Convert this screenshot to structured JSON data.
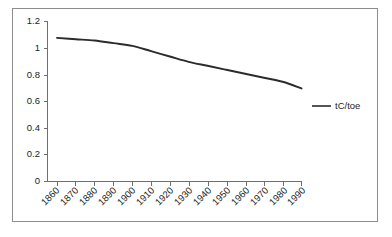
{
  "chart_data": {
    "type": "line",
    "title": "",
    "subtitle": "",
    "xlabel": "",
    "ylabel": "",
    "grid": false,
    "legend_position": "right",
    "xlim": [
      1860,
      1990
    ],
    "ylim": [
      0,
      1.2
    ],
    "ytick_labels": [
      "0",
      "0.2",
      "0.4",
      "0.6",
      "0.8",
      "1",
      "1.2"
    ],
    "ytick_values": [
      0,
      0.2,
      0.4,
      0.6,
      0.8,
      1.0,
      1.2
    ],
    "categories": [
      "1860",
      "1870",
      "1880",
      "1890",
      "1900",
      "1910",
      "1920",
      "1930",
      "1940",
      "1950",
      "1960",
      "1970",
      "1980",
      "1990"
    ],
    "x": [
      1860,
      1870,
      1880,
      1890,
      1900,
      1910,
      1920,
      1930,
      1940,
      1950,
      1960,
      1970,
      1980,
      1990
    ],
    "series": [
      {
        "name": "tC/toe",
        "color": "#2b2b2b",
        "values": [
          1.08,
          1.07,
          1.06,
          1.04,
          1.02,
          0.98,
          0.94,
          0.9,
          0.87,
          0.84,
          0.81,
          0.78,
          0.75,
          0.7
        ]
      }
    ],
    "legend": [
      {
        "label": "tC/toe",
        "color": "#2b2b2b",
        "marker": "line"
      }
    ],
    "annotations": []
  },
  "figure": {
    "frame_color": "#8d8d8d",
    "background": "#ffffff",
    "axis_color": "#6f6f6f"
  }
}
